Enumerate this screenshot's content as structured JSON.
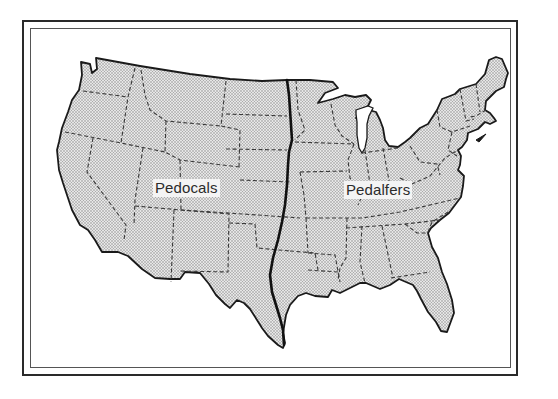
{
  "figure": {
    "type": "thematic map",
    "regions": [
      {
        "id": "west",
        "label": "Pedocals"
      },
      {
        "id": "east",
        "label": "Pedalfers"
      }
    ],
    "boundary": {
      "description": "bold line separating Pedocals (west) and Pedalfers (east)",
      "color": "#111111"
    },
    "styles": {
      "land_fill": "stipple dot pattern",
      "dot_color": "#8a8a8a",
      "state_border_style": "dashed",
      "state_border_color": "#3a3a3a",
      "coastline_color": "#1a1a1a",
      "frame_color": "#2a2a2a"
    }
  }
}
